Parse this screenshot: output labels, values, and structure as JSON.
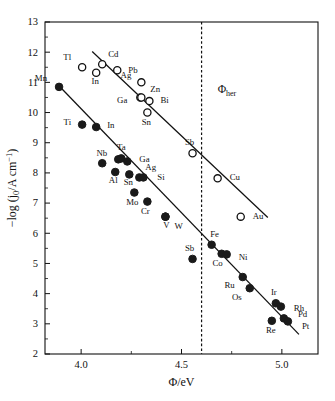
{
  "chart_data": {
    "type": "scatter",
    "title": "",
    "xlabel": "Φ/eV",
    "ylabel": "−log (j0/A cm−1)",
    "ylabel_parts": {
      "prefix": "−log (j",
      "sub": "0",
      "mid": "/A cm",
      "sup": "−1",
      "suffix": ")"
    },
    "xlim": [
      3.82,
      5.18
    ],
    "ylim": [
      2,
      13
    ],
    "xticks": [
      4.0,
      4.5,
      5.0
    ],
    "xticklabels": [
      "4.0",
      "4.5",
      "5.0"
    ],
    "xminorticks": [
      4.25,
      4.75
    ],
    "yticks": [
      2,
      3,
      4,
      5,
      6,
      7,
      8,
      9,
      10,
      11,
      12,
      13
    ],
    "yticklabels": [
      "2",
      "3",
      "4",
      "5",
      "6",
      "7",
      "8",
      "9",
      "10",
      "11",
      "12",
      "13"
    ],
    "yminorticks": [
      2.5,
      3.5,
      4.5,
      5.5,
      6.5,
      7.5,
      8.5,
      9.5,
      10.5,
      11.5,
      12.5
    ],
    "grid": false,
    "legend": null,
    "annotations": [
      {
        "name": "phi-her-label",
        "text": "Φ",
        "sub": "her",
        "x": 4.68,
        "y": 10.65
      }
    ],
    "vertical_line": {
      "name": "phi-her-line",
      "x": 4.6,
      "style": "dashed",
      "color": "#111111"
    },
    "trend_lines": [
      {
        "name": "upper-trend-line",
        "x1": 4.055,
        "y1": 12.02,
        "x2": 4.93,
        "y2": 6.52,
        "color": "#111111"
      },
      {
        "name": "lower-trend-line",
        "x1": 3.905,
        "y1": 10.78,
        "x2": 5.085,
        "y2": 2.65,
        "color": "#111111"
      }
    ],
    "series": [
      {
        "name": "sp-metals-open",
        "marker": "open-circle",
        "marker_fill": "#ffffff",
        "marker_stroke": "#111111",
        "points": [
          {
            "label": "Tl",
            "x": 4.005,
            "y": 11.5,
            "lx": -11,
            "ly": -7
          },
          {
            "label": "In",
            "x": 4.075,
            "y": 11.32,
            "lx": -1,
            "ly": 11
          },
          {
            "label": "Cd",
            "x": 4.105,
            "y": 11.6,
            "lx": 6,
            "ly": -7
          },
          {
            "label": "Pb",
            "x": 4.18,
            "y": 11.4,
            "lx": 11,
            "ly": 3
          },
          {
            "label": "Ag",
            "x": 4.3,
            "y": 11.0,
            "lx": -10,
            "ly": -4
          },
          {
            "label": "Zn",
            "x": 4.295,
            "y": 10.5,
            "lx": 10,
            "ly": -5
          },
          {
            "label": "Bi",
            "x": 4.34,
            "y": 10.38,
            "lx": 11,
            "ly": 2
          },
          {
            "label": "Ga",
            "x": 4.3,
            "y": 10.5,
            "lx": -14,
            "ly": 6
          },
          {
            "label": "Sn",
            "x": 4.33,
            "y": 10.0,
            "lx": -1,
            "ly": 12
          },
          {
            "label": "Sb",
            "x": 4.555,
            "y": 8.65,
            "lx": -3,
            "ly": -8
          },
          {
            "label": "Cu",
            "x": 4.68,
            "y": 7.82,
            "lx": 12,
            "ly": 2
          },
          {
            "label": "Au",
            "x": 4.795,
            "y": 6.55,
            "lx": 12,
            "ly": 2
          }
        ]
      },
      {
        "name": "d-metals-filled",
        "marker": "filled-circle",
        "marker_fill": "#1a1a1a",
        "marker_stroke": "#1a1a1a",
        "points": [
          {
            "label": "Mn",
            "x": 3.89,
            "y": 10.85,
            "lx": -12,
            "ly": -6
          },
          {
            "label": "Ti",
            "x": 4.005,
            "y": 9.6,
            "lx": -11,
            "ly": 0
          },
          {
            "label": "In",
            "x": 4.075,
            "y": 9.52,
            "lx": 11,
            "ly": 1
          },
          {
            "label": "Nb",
            "x": 4.185,
            "y": 8.45,
            "lx": -11,
            "ly": -3
          },
          {
            "label": "Ta",
            "x": 4.2,
            "y": 8.48,
            "lx": 0,
            "ly": -8
          },
          {
            "label": "Ga",
            "x": 4.23,
            "y": 8.38,
            "lx": 12,
            "ly": 1
          },
          {
            "label": "",
            "x": 4.105,
            "y": 8.32,
            "lx": 0,
            "ly": 0
          },
          {
            "label": "Al",
            "x": 4.17,
            "y": 8.03,
            "lx": -2,
            "ly": 11
          },
          {
            "label": "Sn",
            "x": 4.24,
            "y": 7.95,
            "lx": -1,
            "ly": 11
          },
          {
            "label": "Ag",
            "x": 4.29,
            "y": 7.85,
            "lx": 6,
            "ly": -7
          },
          {
            "label": "Si",
            "x": 4.31,
            "y": 7.85,
            "lx": 14,
            "ly": 3
          },
          {
            "label": "Mo",
            "x": 4.265,
            "y": 7.35,
            "lx": -2,
            "ly": 12
          },
          {
            "label": "Cr",
            "x": 4.33,
            "y": 7.05,
            "lx": -2,
            "ly": 12
          },
          {
            "label": "V",
            "x": 4.42,
            "y": 6.55,
            "lx": 1,
            "ly": 11
          },
          {
            "label": "W",
            "x": 4.42,
            "y": 6.55,
            "lx": 9,
            "ly": 12
          },
          {
            "label": "Sb",
            "x": 4.555,
            "y": 5.15,
            "lx": -3,
            "ly": -8
          },
          {
            "label": "Fe",
            "x": 4.65,
            "y": 5.62,
            "lx": 3,
            "ly": -8
          },
          {
            "label": "Co",
            "x": 4.7,
            "y": 5.32,
            "lx": -4,
            "ly": 12
          },
          {
            "label": "Ni",
            "x": 4.725,
            "y": 5.3,
            "lx": 12,
            "ly": 6
          },
          {
            "label": "Ru",
            "x": 4.805,
            "y": 4.55,
            "lx": -8,
            "ly": 11
          },
          {
            "label": "Os",
            "x": 4.84,
            "y": 4.18,
            "lx": -8,
            "ly": 12
          },
          {
            "label": "Ir",
            "x": 4.97,
            "y": 3.68,
            "lx": -2,
            "ly": -8
          },
          {
            "label": "Rh",
            "x": 4.995,
            "y": 3.57,
            "lx": 13,
            "ly": 4
          },
          {
            "label": "Pd",
            "x": 5.01,
            "y": 3.18,
            "lx": 14,
            "ly": -1
          },
          {
            "label": "Pt",
            "x": 5.03,
            "y": 3.08,
            "lx": 14,
            "ly": 8
          },
          {
            "label": "Re",
            "x": 4.95,
            "y": 3.1,
            "lx": -1,
            "ly": 12
          }
        ]
      }
    ]
  },
  "figure": {
    "background": "#ffffff",
    "frame_color": "#111111"
  }
}
